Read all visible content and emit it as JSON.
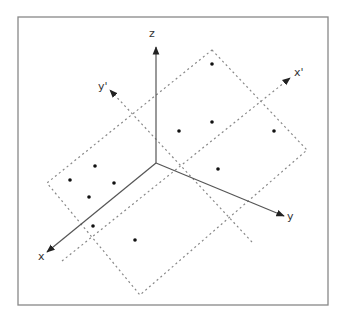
{
  "diagram": {
    "title": "",
    "frame": {
      "x": 18,
      "y": 17,
      "width": 310,
      "height": 288,
      "stroke": "#888888"
    },
    "origin": {
      "x": 156,
      "y": 163
    },
    "colors": {
      "axis": "#555555",
      "dashed": "#888888",
      "point": "#111111",
      "label": "#333333"
    },
    "axes": [
      {
        "id": "z",
        "label": "z",
        "end": {
          "x": 156,
          "y": 47
        },
        "label_pos": {
          "x": 149,
          "y": 37
        }
      },
      {
        "id": "x",
        "label": "x",
        "end": {
          "x": 47,
          "y": 252
        },
        "label_pos": {
          "x": 38,
          "y": 260
        }
      },
      {
        "id": "y",
        "label": "y",
        "end": {
          "x": 284,
          "y": 216
        },
        "label_pos": {
          "x": 287,
          "y": 220
        }
      }
    ],
    "rotated_axes": [
      {
        "id": "x-prime",
        "label": "x'",
        "start": {
          "x": 62,
          "y": 261
        },
        "end": {
          "x": 290,
          "y": 78
        },
        "label_pos": {
          "x": 294,
          "y": 76
        }
      },
      {
        "id": "y-prime",
        "label": "y'",
        "start": {
          "x": 252,
          "y": 242
        },
        "end": {
          "x": 110,
          "y": 90
        },
        "label_pos": {
          "x": 98,
          "y": 90
        }
      }
    ],
    "plane": {
      "points": [
        [
          212,
          50
        ],
        [
          307,
          150
        ],
        [
          140,
          295
        ],
        [
          47,
          183
        ]
      ]
    },
    "points": [
      {
        "x": 212,
        "y": 64
      },
      {
        "x": 179,
        "y": 131
      },
      {
        "x": 212,
        "y": 122
      },
      {
        "x": 274,
        "y": 131
      },
      {
        "x": 218,
        "y": 169
      },
      {
        "x": 95,
        "y": 166
      },
      {
        "x": 70,
        "y": 180
      },
      {
        "x": 114,
        "y": 183
      },
      {
        "x": 89,
        "y": 197
      },
      {
        "x": 93,
        "y": 226
      },
      {
        "x": 135,
        "y": 240
      }
    ]
  }
}
